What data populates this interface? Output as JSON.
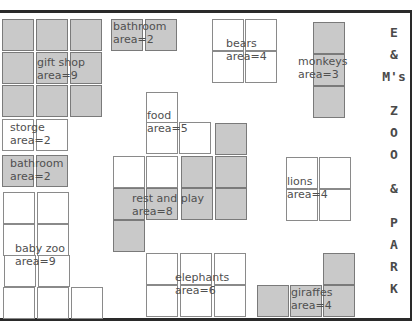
{
  "title": {
    "lines": [
      "E",
      "&",
      "M's",
      "",
      "Z",
      "O",
      "O",
      "",
      "&",
      "",
      "P",
      "A",
      "R",
      "K"
    ]
  },
  "areas": [
    {
      "id": "gift-shop",
      "name": "gift shop",
      "area_label": "area=9",
      "fill": "grey",
      "label_pos": [
        37,
        56
      ],
      "cells": [
        [
          2,
          19
        ],
        [
          36,
          19
        ],
        [
          70,
          19
        ],
        [
          2,
          52
        ],
        [
          36,
          52
        ],
        [
          70,
          52
        ],
        [
          2,
          85
        ],
        [
          36,
          85
        ],
        [
          70,
          85
        ]
      ]
    },
    {
      "id": "bathroom-top",
      "name": "bathroom",
      "area_label": "area=2",
      "fill": "grey",
      "label_pos": [
        113,
        20
      ],
      "cells": [
        [
          111,
          19
        ],
        [
          145,
          19
        ]
      ]
    },
    {
      "id": "bears",
      "name": "bears",
      "area_label": "area=4",
      "fill": "white",
      "label_pos": [
        226,
        37
      ],
      "cells": [
        [
          212,
          19
        ],
        [
          245,
          19
        ],
        [
          212,
          51
        ],
        [
          245,
          51
        ]
      ]
    },
    {
      "id": "monkeys",
      "name": "monkeys",
      "area_label": "area=3",
      "fill": "grey",
      "label_pos": [
        298,
        55
      ],
      "cells": [
        [
          313,
          22
        ],
        [
          313,
          54
        ],
        [
          313,
          86
        ]
      ]
    },
    {
      "id": "storge",
      "name": "storge",
      "area_label": "area=2",
      "fill": "white",
      "label_pos": [
        10,
        121
      ],
      "cells": [
        [
          2,
          119
        ],
        [
          36,
          119
        ]
      ]
    },
    {
      "id": "bathroom-left",
      "name": "bathroom",
      "area_label": "area=2",
      "fill": "grey",
      "label_pos": [
        10,
        157
      ],
      "cells": [
        [
          2,
          155
        ],
        [
          36,
          155
        ]
      ]
    },
    {
      "id": "food",
      "name": "food",
      "area_label": "area=5",
      "fill": "white",
      "label_pos": [
        147,
        109
      ],
      "cells": [
        [
          146,
          92
        ],
        [
          146,
          122
        ],
        [
          179,
          122
        ],
        [
          113,
          156
        ],
        [
          146,
          156
        ]
      ]
    },
    {
      "id": "rest-and-play",
      "name": "rest and play",
      "area_label": "area=8",
      "fill": "grey",
      "label_pos": [
        132,
        192
      ],
      "cells": [
        [
          215,
          123
        ],
        [
          181,
          156
        ],
        [
          215,
          156
        ],
        [
          113,
          188
        ],
        [
          146,
          188
        ],
        [
          181,
          188
        ],
        [
          215,
          188
        ],
        [
          113,
          220
        ]
      ]
    },
    {
      "id": "lions",
      "name": "lions",
      "area_label": "area=4",
      "fill": "white",
      "label_pos": [
        287,
        175
      ],
      "cells": [
        [
          286,
          157
        ],
        [
          319,
          157
        ],
        [
          286,
          189
        ],
        [
          319,
          189
        ]
      ]
    },
    {
      "id": "baby-zoo",
      "name": "baby zoo",
      "area_label": "area=9",
      "fill": "white",
      "label_pos": [
        15,
        242
      ],
      "cells": [
        [
          3,
          192
        ],
        [
          37,
          192
        ],
        [
          3,
          224
        ],
        [
          37,
          224
        ],
        [
          4,
          255
        ],
        [
          38,
          255
        ],
        [
          3,
          287
        ],
        [
          37,
          287
        ],
        [
          71,
          287
        ]
      ]
    },
    {
      "id": "elephants",
      "name": "elephants",
      "area_label": "area=6",
      "fill": "white",
      "label_pos": [
        175,
        271
      ],
      "cells": [
        [
          146,
          253
        ],
        [
          180,
          253
        ],
        [
          214,
          253
        ],
        [
          146,
          285
        ],
        [
          180,
          285
        ],
        [
          214,
          285
        ]
      ]
    },
    {
      "id": "giraffes",
      "name": "giraffes",
      "area_label": "area=4",
      "fill": "grey",
      "label_pos": [
        291,
        286
      ],
      "cells": [
        [
          323,
          253
        ],
        [
          257,
          285
        ],
        [
          290,
          285
        ],
        [
          323,
          285
        ]
      ]
    }
  ]
}
